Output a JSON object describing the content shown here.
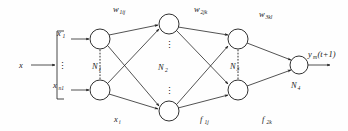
{
  "figure": {
    "background": "#fefefe",
    "ink": "#1a1a1a"
  },
  "input": {
    "signal_label": "x",
    "first_label": "x",
    "first_sub": "1",
    "last_label": "x",
    "last_sub": "n1",
    "vdots": "⋮"
  },
  "weights": [
    {
      "name": "w",
      "base": "w",
      "sub": "1ij",
      "x": 120,
      "y": 12
    },
    {
      "name": "w",
      "base": "w",
      "sub": "2jk",
      "x": 200,
      "y": 12
    },
    {
      "name": "w",
      "base": "w",
      "sub": "3kl",
      "x": 266,
      "y": 16
    }
  ],
  "layers": [
    {
      "id": "N1",
      "base": "N",
      "sub": "1",
      "label_x": 97,
      "label_y": 66
    },
    {
      "id": "N2",
      "base": "N",
      "sub": "2",
      "label_x": 163,
      "label_y": 68
    },
    {
      "id": "N3",
      "base": "N",
      "sub": "3",
      "label_x": 228,
      "label_y": 66
    },
    {
      "id": "N4",
      "base": "N",
      "sub": "4",
      "label_x": 296,
      "label_y": 88
    }
  ],
  "activations": [
    {
      "base": "x",
      "sub": "i",
      "x": 118,
      "y": 120
    },
    {
      "base": "f",
      "sub": "1j",
      "x": 203,
      "y": 120
    },
    {
      "base": "f",
      "sub": "2k",
      "x": 265,
      "y": 120
    }
  ],
  "output": {
    "base": "y",
    "sub": "m",
    "arg": "(t+1)",
    "x": 312,
    "y": 55
  },
  "nodes": {
    "layer1": [
      {
        "cx": 100,
        "cy": 39,
        "r": 10
      },
      {
        "cx": 100,
        "cy": 90,
        "r": 10
      }
    ],
    "layer2": [
      {
        "cx": 169,
        "cy": 24,
        "r": 10
      },
      {
        "cx": 169,
        "cy": 111,
        "r": 10
      }
    ],
    "layer3": [
      {
        "cx": 238,
        "cy": 39,
        "r": 10
      },
      {
        "cx": 238,
        "cy": 90,
        "r": 10
      }
    ],
    "layer4": [
      {
        "cx": 299,
        "cy": 65,
        "r": 9
      }
    ]
  }
}
